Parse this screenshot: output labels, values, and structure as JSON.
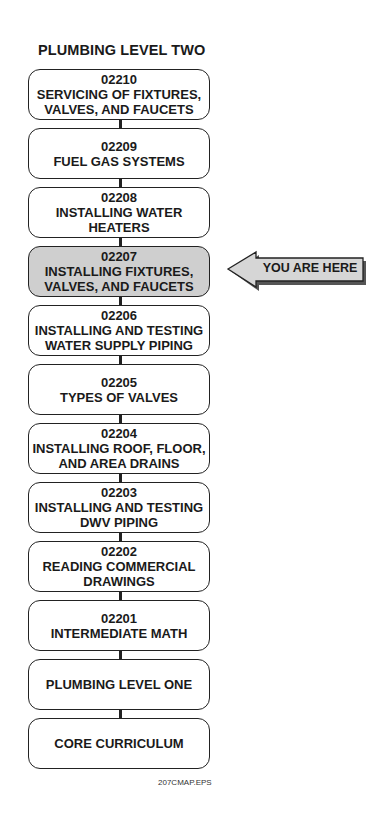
{
  "title": "PLUMBING LEVEL TWO",
  "modules": [
    {
      "code": "02210",
      "lines": [
        "SERVICING OF FIXTURES,",
        "VALVES, AND FAUCETS"
      ],
      "current": false
    },
    {
      "code": "02209",
      "lines": [
        "FUEL GAS SYSTEMS"
      ],
      "current": false
    },
    {
      "code": "02208",
      "lines": [
        "INSTALLING WATER",
        "HEATERS"
      ],
      "current": false
    },
    {
      "code": "02207",
      "lines": [
        "INSTALLING FIXTURES,",
        "VALVES, AND FAUCETS"
      ],
      "current": true
    },
    {
      "code": "02206",
      "lines": [
        "INSTALLING AND TESTING",
        "WATER SUPPLY PIPING"
      ],
      "current": false
    },
    {
      "code": "02205",
      "lines": [
        "TYPES OF VALVES"
      ],
      "current": false
    },
    {
      "code": "02204",
      "lines": [
        "INSTALLING ROOF, FLOOR,",
        "AND AREA DRAINS"
      ],
      "current": false
    },
    {
      "code": "02203",
      "lines": [
        "INSTALLING AND TESTING",
        "DWV PIPING"
      ],
      "current": false
    },
    {
      "code": "02202",
      "lines": [
        "READING COMMERCIAL",
        "DRAWINGS"
      ],
      "current": false
    },
    {
      "code": "02201",
      "lines": [
        "INTERMEDIATE MATH"
      ],
      "current": false
    },
    {
      "code": "",
      "lines": [
        "PLUMBING LEVEL ONE"
      ],
      "current": false
    },
    {
      "code": "",
      "lines": [
        "CORE CURRICULUM"
      ],
      "current": false
    }
  ],
  "you_are_here": "YOU ARE HERE",
  "file_label": "207CMAP.EPS",
  "colors": {
    "current_fill": "#cfcfcf",
    "arrow_fill": "#d6d6d6",
    "arrow_shadow": "#555555",
    "border": "#222222"
  }
}
